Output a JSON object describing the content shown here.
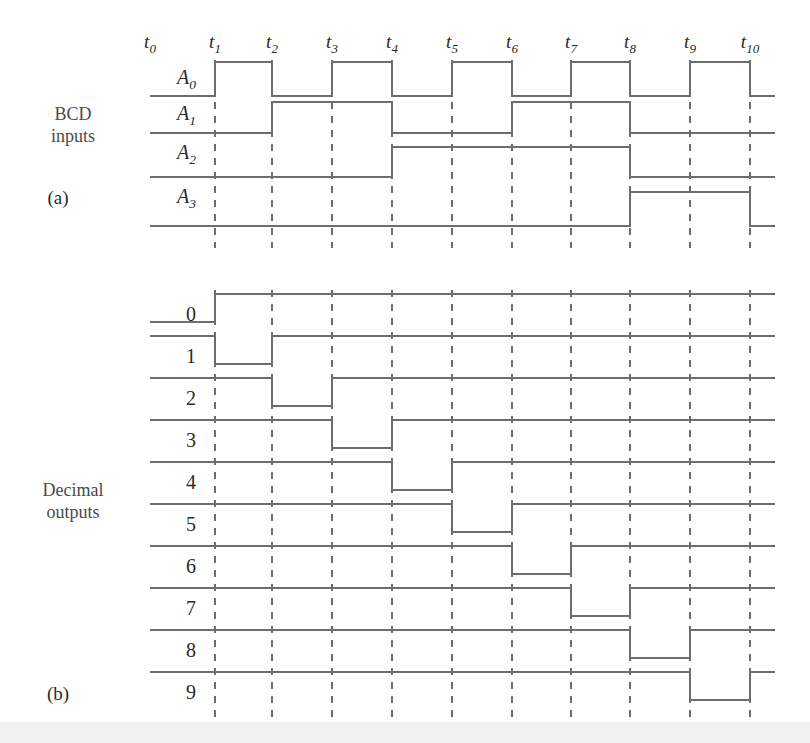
{
  "figure": {
    "part_a_label": "(a)",
    "part_b_label": "(b)",
    "input_group_line1": "BCD",
    "input_group_line2": "inputs",
    "output_group_line1": "Decimal",
    "output_group_line2": "outputs"
  },
  "style": {
    "wave_color": "#6e6e6e",
    "tick_color": "#555555",
    "text_color": "#2a2a2a",
    "group_text_color": "#4a4a4a",
    "background": "#ffffff",
    "bottom_band": "#f1f1f1"
  },
  "time_axis": {
    "labels": [
      "t0",
      "t1",
      "t2",
      "t3",
      "t4",
      "t5",
      "t6",
      "t7",
      "t8",
      "t9",
      "t10"
    ],
    "base": "t",
    "subscripts": [
      "0",
      "1",
      "2",
      "3",
      "4",
      "5",
      "6",
      "7",
      "8",
      "9",
      "10"
    ],
    "x_positions": [
      150,
      215,
      272,
      332,
      392,
      452,
      512,
      571,
      630,
      690,
      750
    ],
    "label_y": 48
  },
  "chart_data": {
    "type": "line",
    "xlabel": "",
    "ylabel": "",
    "x": [
      "t0",
      "t1",
      "t2",
      "t3",
      "t4",
      "t5",
      "t6",
      "t7",
      "t8",
      "t9",
      "t10"
    ],
    "grid": "dashed vertical ticks at each t-marker",
    "legend": "none",
    "series": [
      {
        "name": "A0",
        "group": "BCD inputs",
        "active": "high",
        "values": [
          0,
          1,
          0,
          1,
          0,
          1,
          0,
          1,
          0,
          1,
          0
        ]
      },
      {
        "name": "A1",
        "group": "BCD inputs",
        "active": "high",
        "values": [
          0,
          0,
          1,
          1,
          0,
          0,
          1,
          1,
          0,
          0,
          0
        ]
      },
      {
        "name": "A2",
        "group": "BCD inputs",
        "active": "high",
        "values": [
          0,
          0,
          0,
          0,
          1,
          1,
          1,
          1,
          0,
          0,
          0
        ]
      },
      {
        "name": "A3",
        "group": "BCD inputs",
        "active": "high",
        "values": [
          0,
          0,
          0,
          0,
          0,
          0,
          0,
          0,
          1,
          1,
          0
        ]
      },
      {
        "name": "0",
        "group": "Decimal outputs",
        "active": "low",
        "values": [
          0,
          1,
          1,
          1,
          1,
          1,
          1,
          1,
          1,
          1,
          1
        ]
      },
      {
        "name": "1",
        "group": "Decimal outputs",
        "active": "low",
        "values": [
          1,
          0,
          1,
          1,
          1,
          1,
          1,
          1,
          1,
          1,
          1
        ]
      },
      {
        "name": "2",
        "group": "Decimal outputs",
        "active": "low",
        "values": [
          1,
          1,
          0,
          1,
          1,
          1,
          1,
          1,
          1,
          1,
          1
        ]
      },
      {
        "name": "3",
        "group": "Decimal outputs",
        "active": "low",
        "values": [
          1,
          1,
          1,
          0,
          1,
          1,
          1,
          1,
          1,
          1,
          1
        ]
      },
      {
        "name": "4",
        "group": "Decimal outputs",
        "active": "low",
        "values": [
          1,
          1,
          1,
          1,
          0,
          1,
          1,
          1,
          1,
          1,
          1
        ]
      },
      {
        "name": "5",
        "group": "Decimal outputs",
        "active": "low",
        "values": [
          1,
          1,
          1,
          1,
          1,
          0,
          1,
          1,
          1,
          1,
          1
        ]
      },
      {
        "name": "6",
        "group": "Decimal outputs",
        "active": "low",
        "values": [
          1,
          1,
          1,
          1,
          1,
          1,
          0,
          1,
          1,
          1,
          1
        ]
      },
      {
        "name": "7",
        "group": "Decimal outputs",
        "active": "low",
        "values": [
          1,
          1,
          1,
          1,
          1,
          1,
          1,
          0,
          1,
          1,
          1
        ]
      },
      {
        "name": "8",
        "group": "Decimal outputs",
        "active": "low",
        "values": [
          1,
          1,
          1,
          1,
          1,
          1,
          1,
          1,
          0,
          1,
          1
        ]
      },
      {
        "name": "9",
        "group": "Decimal outputs",
        "active": "low",
        "values": [
          1,
          1,
          1,
          1,
          1,
          1,
          1,
          1,
          1,
          0,
          1
        ]
      }
    ]
  },
  "inputs": [
    {
      "base": "A",
      "sub": "0",
      "label_x": 196,
      "label_y": 84,
      "low_y": 96,
      "high_y": 62
    },
    {
      "base": "A",
      "sub": "1",
      "label_x": 196,
      "label_y": 120,
      "low_y": 133,
      "high_y": 102
    },
    {
      "base": "A",
      "sub": "2",
      "label_x": 196,
      "label_y": 159,
      "low_y": 177,
      "high_y": 147
    },
    {
      "base": "A",
      "sub": "3",
      "label_x": 196,
      "label_y": 203,
      "low_y": 226,
      "high_y": 192
    }
  ],
  "outputs": [
    {
      "label": "0",
      "label_x": 196,
      "label_y": 321,
      "high_y": 294,
      "low_y": 322
    },
    {
      "label": "1",
      "label_x": 196,
      "label_y": 363,
      "high_y": 336,
      "low_y": 364
    },
    {
      "label": "2",
      "label_x": 196,
      "label_y": 405,
      "high_y": 378,
      "low_y": 406
    },
    {
      "label": "3",
      "label_x": 196,
      "label_y": 447,
      "high_y": 420,
      "low_y": 448
    },
    {
      "label": "4",
      "label_x": 196,
      "label_y": 489,
      "high_y": 462,
      "low_y": 490
    },
    {
      "label": "5",
      "label_x": 196,
      "label_y": 531,
      "high_y": 504,
      "low_y": 532
    },
    {
      "label": "6",
      "label_x": 196,
      "label_y": 573,
      "high_y": 546,
      "low_y": 574
    },
    {
      "label": "7",
      "label_x": 196,
      "label_y": 615,
      "high_y": 588,
      "low_y": 616
    },
    {
      "label": "8",
      "label_x": 196,
      "label_y": 657,
      "high_y": 630,
      "low_y": 658
    },
    {
      "label": "9",
      "label_x": 196,
      "label_y": 699,
      "high_y": 672,
      "low_y": 700
    }
  ],
  "annotations": {
    "bcd_group_x": 73,
    "bcd_group_y1": 120,
    "bcd_group_y2": 142,
    "part_a_x": 58,
    "part_a_y": 204,
    "dec_group_x": 73,
    "dec_group_y1": 496,
    "dec_group_y2": 518,
    "part_b_x": 58,
    "part_b_y": 700
  },
  "geometry": {
    "x_start": 150,
    "x_end": 775,
    "tick_top": 60,
    "tick_bottom_a": 248,
    "tick_top_b": 290,
    "tick_bottom_b": 718
  }
}
